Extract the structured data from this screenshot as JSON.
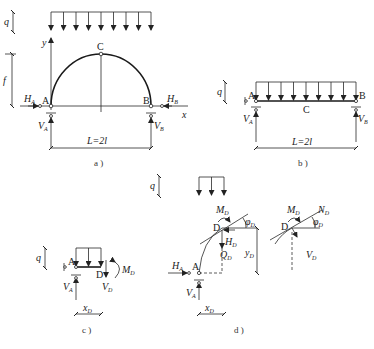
{
  "figure": {
    "panels": [
      {
        "id": "a",
        "caption": "a )",
        "title": "Three-hinged semicircular arch under uniform load",
        "load": "q",
        "rise": "f",
        "span": "L=2l",
        "points": [
          "A",
          "B",
          "C"
        ],
        "axes": [
          "x",
          "y"
        ],
        "reactions": [
          "H_A",
          "H_B",
          "V_A",
          "V_B"
        ]
      },
      {
        "id": "b",
        "caption": "b )",
        "title": "Equivalent simply supported beam",
        "load": "q",
        "span": "L=2l",
        "points": [
          "A",
          "B",
          "C"
        ],
        "reactions": [
          "V°_A",
          "V°_B"
        ]
      },
      {
        "id": "c",
        "caption": "c )",
        "title": "Beam free body A–D",
        "load": "q",
        "length": "x_D",
        "points": [
          "A",
          "D"
        ],
        "forces": [
          "V°_A",
          "V°_D",
          "M°_D"
        ]
      },
      {
        "id": "d",
        "caption": "d )",
        "title": "Arch free body A–D and section D forces",
        "load": "q",
        "lengths": [
          "x_D",
          "y_D"
        ],
        "points": [
          "A",
          "D"
        ],
        "forces": [
          "H_A",
          "V_A",
          "M_D",
          "H_D",
          "Q_D",
          "N_D",
          "V_D"
        ],
        "angle": "φ_D"
      }
    ]
  },
  "labels": {
    "q": "q",
    "f": "f",
    "x": "x",
    "y": "y",
    "A": "A",
    "B": "B",
    "C": "C",
    "D": "D",
    "L": "L=2l",
    "H": "H",
    "V": "V",
    "M": "M",
    "Q": "Q",
    "N": "N",
    "xD": "x",
    "yD": "y",
    "phi": "φ",
    "subA": "A",
    "subB": "B",
    "subD": "D",
    "zero": "0",
    "cap_a": "a )",
    "cap_b": "b )",
    "cap_c": "c )",
    "cap_d": "d )"
  },
  "colors": {
    "line": "#2a2a2a",
    "background": "#ffffff"
  }
}
